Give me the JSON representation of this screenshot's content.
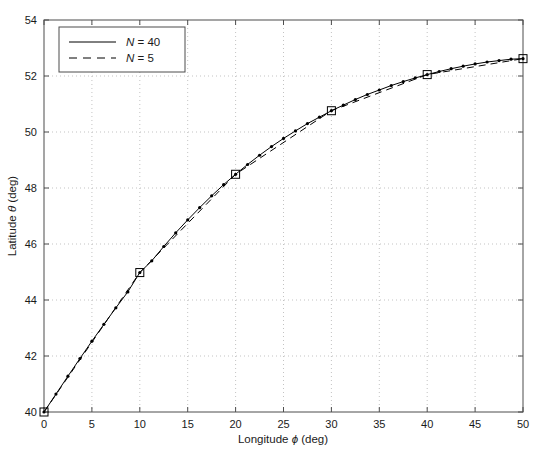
{
  "chart_data": {
    "type": "line",
    "title": "",
    "xlabel": "Longitude ϕ (deg)",
    "ylabel": "Latitude θ (deg)",
    "xlim": [
      0,
      50
    ],
    "ylim": [
      40,
      54
    ],
    "xticks": [
      0,
      5,
      10,
      15,
      20,
      25,
      30,
      35,
      40,
      45,
      50
    ],
    "yticks": [
      40,
      42,
      44,
      46,
      48,
      50,
      52,
      54
    ],
    "xtick_labels": [
      "0",
      "5",
      "10",
      "15",
      "20",
      "25",
      "30",
      "35",
      "40",
      "45",
      "50"
    ],
    "ytick_labels": [
      "40",
      "42",
      "44",
      "46",
      "48",
      "50",
      "52",
      "54"
    ],
    "grid": true,
    "grid_style": "dotted",
    "grid_color": "#b4b4b4",
    "legend_position": "top-left",
    "series": [
      {
        "name": "N = 40",
        "label_prefix": "N",
        "label_value": "40",
        "linestyle": "solid",
        "color": "#000000",
        "marker": "dot",
        "x": [
          0,
          1.25,
          2.5,
          3.75,
          5,
          6.25,
          7.5,
          8.75,
          10,
          11.25,
          12.5,
          13.75,
          15,
          16.25,
          17.5,
          18.75,
          20,
          21.25,
          22.5,
          23.75,
          25,
          26.25,
          27.5,
          28.75,
          30,
          31.25,
          32.5,
          33.75,
          35,
          36.25,
          37.5,
          38.75,
          40,
          41.25,
          42.5,
          43.75,
          45,
          46.25,
          47.5,
          48.75,
          50
        ],
        "y": [
          40.0,
          40.64,
          41.28,
          41.91,
          42.53,
          43.13,
          43.72,
          44.29,
          44.98,
          45.4,
          45.91,
          46.4,
          46.86,
          47.3,
          47.72,
          48.12,
          48.49,
          48.84,
          49.17,
          49.48,
          49.77,
          50.04,
          50.3,
          50.53,
          50.76,
          50.96,
          51.16,
          51.34,
          51.5,
          51.66,
          51.8,
          51.93,
          52.05,
          52.16,
          52.26,
          52.35,
          52.43,
          52.5,
          52.55,
          52.6,
          52.62
        ]
      },
      {
        "name": "N = 5",
        "label_prefix": "N",
        "label_value": "5",
        "linestyle": "dashed",
        "color": "#000000",
        "marker": "square",
        "x": [
          0,
          10,
          20,
          30,
          40,
          50
        ],
        "y": [
          40.0,
          44.98,
          48.49,
          50.76,
          52.05,
          52.62
        ]
      }
    ]
  }
}
